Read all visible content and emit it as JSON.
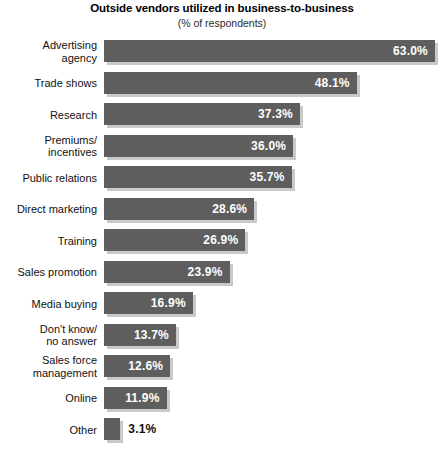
{
  "chart_data": {
    "type": "bar",
    "orientation": "horizontal",
    "title": "Outside vendors utilized in business-to-business",
    "subtitle": "(% of respondents)",
    "xlabel": "",
    "ylabel": "",
    "xlim": [
      0,
      63
    ],
    "grid": false,
    "legend": false,
    "value_suffix": "%",
    "categories": [
      "Advertising\nagency",
      "Trade shows",
      "Research",
      "Premiums/\nincentives",
      "Public relations",
      "Direct marketing",
      "Training",
      "Sales promotion",
      "Media buying",
      "Don't know/\nno answer",
      "Sales force\nmanagement",
      "Online",
      "Other"
    ],
    "values": [
      63.0,
      48.1,
      37.3,
      36.0,
      35.7,
      28.6,
      26.9,
      23.9,
      16.9,
      13.7,
      12.6,
      11.9,
      3.1
    ],
    "value_labels": [
      "63.0%",
      "48.1%",
      "37.3%",
      "36.0%",
      "35.7%",
      "28.6%",
      "26.9%",
      "23.9%",
      "16.9%",
      "13.7%",
      "12.6%",
      "11.9%",
      "3.1%"
    ],
    "label_placement": [
      "inside",
      "inside",
      "inside",
      "inside",
      "inside",
      "inside",
      "inside",
      "inside",
      "inside",
      "inside",
      "inside",
      "inside",
      "outside"
    ],
    "colors": {
      "bar": "#5e5e5e",
      "bar_shadow": "#c9c9c9",
      "background": "#ffffff",
      "label_inside": "#ffffff",
      "label_outside": "#111111",
      "title": "#000000"
    }
  }
}
